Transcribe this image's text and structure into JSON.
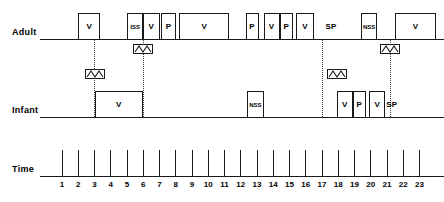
{
  "chart_data": {
    "type": "timeline",
    "title": "",
    "xlabel": "Time",
    "axis": {
      "ticks": [
        1,
        2,
        3,
        4,
        5,
        6,
        7,
        8,
        9,
        10,
        11,
        12,
        13,
        14,
        15,
        16,
        17,
        18,
        19,
        20,
        21,
        22,
        23
      ],
      "min": 0.8,
      "max": 23.6,
      "grid": false
    },
    "rows": [
      {
        "label": "Adult",
        "events": [
          {
            "label": "V",
            "start": 2.0,
            "end": 3.35,
            "boxed": true
          },
          {
            "label": "ISS",
            "start": 5.0,
            "end": 6.0,
            "boxed": true
          },
          {
            "label": "V",
            "start": 6.0,
            "end": 7.0,
            "boxed": true
          },
          {
            "label": "P",
            "start": 7.1,
            "end": 8.0,
            "boxed": true
          },
          {
            "label": "V",
            "start": 8.2,
            "end": 11.3,
            "boxed": true
          },
          {
            "label": "P",
            "start": 12.3,
            "end": 13.1,
            "boxed": true
          },
          {
            "label": "V",
            "start": 13.4,
            "end": 14.4,
            "boxed": true
          },
          {
            "label": "P",
            "start": 14.4,
            "end": 15.2,
            "boxed": true
          },
          {
            "label": "V",
            "start": 15.4,
            "end": 16.5,
            "boxed": true
          },
          {
            "label": "SP",
            "start": 17.0,
            "end": 18.1,
            "boxed": false
          },
          {
            "label": "NSS",
            "start": 19.4,
            "end": 20.4,
            "boxed": true
          },
          {
            "label": "V",
            "start": 21.5,
            "end": 24.0,
            "boxed": true
          }
        ],
        "markers": [
          {
            "at": 6.0
          },
          {
            "at": 21.2
          }
        ]
      },
      {
        "label": "Infant",
        "events": [
          {
            "label": "V",
            "start": 3.0,
            "end": 6.0,
            "boxed": true
          },
          {
            "label": "NSS",
            "start": 12.4,
            "end": 13.4,
            "boxed": true
          },
          {
            "label": "V",
            "start": 17.9,
            "end": 18.9,
            "boxed": true
          },
          {
            "label": "P",
            "start": 18.9,
            "end": 19.7,
            "boxed": true
          },
          {
            "label": "V",
            "start": 19.9,
            "end": 20.9,
            "boxed": true
          },
          {
            "label": "SP",
            "start": 20.9,
            "end": 21.7,
            "boxed": false
          }
        ],
        "markers": [
          {
            "at": 3.0
          },
          {
            "at": 17.9
          }
        ]
      }
    ],
    "connectors": [
      {
        "at": 3.0,
        "from_row": 0,
        "to_row": 1
      },
      {
        "at": 6.0,
        "from_row": 0,
        "to_row": 1
      },
      {
        "at": 17.0,
        "from_row": 0,
        "to_row": 1
      },
      {
        "at": 21.2,
        "from_row": 0,
        "to_row": 1
      }
    ],
    "legend": [],
    "annotations": []
  },
  "labels": {
    "adult_row": "Adult",
    "infant_row": "Infant",
    "time_row": "Time"
  },
  "colors": {
    "stroke": "#1a1a1a",
    "dotted": "#3a3a3a",
    "background": "#ffffff"
  }
}
